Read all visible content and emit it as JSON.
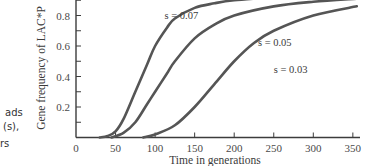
{
  "side_caption": {
    "lines": [
      "ads",
      "(s),",
      "rs"
    ]
  },
  "chart_data": {
    "type": "line",
    "title": "",
    "xlabel": "Time in generations",
    "ylabel": "Gene frequency of LAC*P",
    "xlim": [
      0,
      355
    ],
    "ylim": [
      0,
      0.9
    ],
    "x_ticks": [
      0,
      50,
      100,
      150,
      200,
      250,
      300,
      350
    ],
    "y_ticks": [
      0.2,
      0.4,
      0.6,
      0.8
    ],
    "y_tick_labels": [
      "0.2",
      "0.4",
      "0.6",
      "0.8"
    ],
    "x_tick_labels": [
      "0",
      "50",
      "100",
      "150",
      "200",
      "250",
      "300",
      "350"
    ],
    "grid": false,
    "legend": "inline curve labels",
    "series": [
      {
        "name": "s = 0.07",
        "x": [
          30,
          40,
          50,
          60,
          75,
          90,
          100,
          115,
          125,
          150,
          175,
          200,
          250,
          300,
          355
        ],
        "y": [
          0.0,
          0.01,
          0.04,
          0.12,
          0.3,
          0.48,
          0.6,
          0.72,
          0.78,
          0.85,
          0.88,
          0.9,
          0.92,
          0.94,
          0.95
        ]
      },
      {
        "name": "s = 0.05",
        "x": [
          45,
          60,
          75,
          90,
          100,
          115,
          125,
          150,
          175,
          200,
          250,
          300,
          355
        ],
        "y": [
          0.0,
          0.03,
          0.1,
          0.22,
          0.3,
          0.42,
          0.5,
          0.65,
          0.74,
          0.8,
          0.86,
          0.89,
          0.91
        ]
      },
      {
        "name": "s = 0.03",
        "x": [
          85,
          100,
          125,
          150,
          175,
          200,
          225,
          250,
          300,
          355
        ],
        "y": [
          0.0,
          0.02,
          0.08,
          0.2,
          0.35,
          0.5,
          0.62,
          0.7,
          0.8,
          0.86
        ]
      }
    ],
    "annotations": [
      {
        "text": "s = 0.07",
        "x": 112,
        "y": 0.78
      },
      {
        "text": "s = 0.05",
        "x": 230,
        "y": 0.6
      },
      {
        "text": "s = 0.03",
        "x": 250,
        "y": 0.42
      }
    ]
  }
}
